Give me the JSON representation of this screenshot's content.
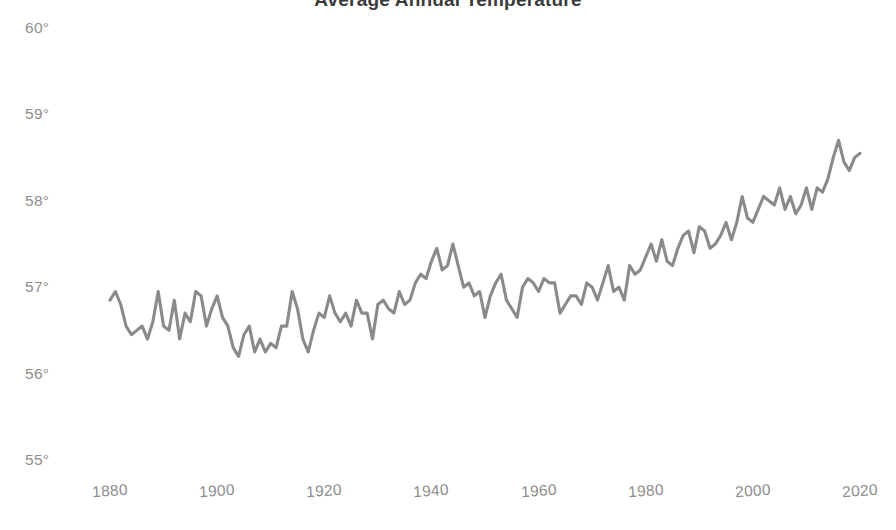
{
  "chart_data": {
    "type": "line",
    "title": "Average Annual Temperature",
    "xlabel": "",
    "ylabel": "",
    "grid": false,
    "legend": "none",
    "line_color": "#8a8a8a",
    "background_color": "#ffffff",
    "xlim": [
      1878,
      2021
    ],
    "ylim": [
      55,
      60
    ],
    "x_ticks": [
      "1880",
      "1900",
      "1920",
      "1940",
      "1960",
      "1980",
      "2000",
      "2020"
    ],
    "x_tick_values": [
      1880,
      1900,
      1920,
      1940,
      1960,
      1980,
      2000,
      2020
    ],
    "y_ticks": [
      "55°",
      "56°",
      "57°",
      "58°",
      "59°",
      "60°"
    ],
    "y_tick_values": [
      55,
      56,
      57,
      58,
      59,
      60
    ],
    "series": [
      {
        "name": "Average annual temperature",
        "x": [
          1880,
          1881,
          1882,
          1883,
          1884,
          1885,
          1886,
          1887,
          1888,
          1889,
          1890,
          1891,
          1892,
          1893,
          1894,
          1895,
          1896,
          1897,
          1898,
          1899,
          1900,
          1901,
          1902,
          1903,
          1904,
          1905,
          1906,
          1907,
          1908,
          1909,
          1910,
          1911,
          1912,
          1913,
          1914,
          1915,
          1916,
          1917,
          1918,
          1919,
          1920,
          1921,
          1922,
          1923,
          1924,
          1925,
          1926,
          1927,
          1928,
          1929,
          1930,
          1931,
          1932,
          1933,
          1934,
          1935,
          1936,
          1937,
          1938,
          1939,
          1940,
          1941,
          1942,
          1943,
          1944,
          1945,
          1946,
          1947,
          1948,
          1949,
          1950,
          1951,
          1952,
          1953,
          1954,
          1955,
          1956,
          1957,
          1958,
          1959,
          1960,
          1961,
          1962,
          1963,
          1964,
          1965,
          1966,
          1967,
          1968,
          1969,
          1970,
          1971,
          1972,
          1973,
          1974,
          1975,
          1976,
          1977,
          1978,
          1979,
          1980,
          1981,
          1982,
          1983,
          1984,
          1985,
          1986,
          1987,
          1988,
          1989,
          1990,
          1991,
          1992,
          1993,
          1994,
          1995,
          1996,
          1997,
          1998,
          1999,
          2000,
          2001,
          2002,
          2003,
          2004,
          2005,
          2006,
          2007,
          2008,
          2009,
          2010,
          2011,
          2012,
          2013,
          2014,
          2015,
          2016,
          2017,
          2018,
          2019,
          2020
        ],
        "values": [
          56.85,
          56.95,
          56.8,
          56.55,
          56.45,
          56.5,
          56.55,
          56.4,
          56.6,
          56.95,
          56.55,
          56.5,
          56.85,
          56.4,
          56.7,
          56.6,
          56.95,
          56.9,
          56.55,
          56.75,
          56.9,
          56.65,
          56.55,
          56.3,
          56.2,
          56.45,
          56.55,
          56.25,
          56.4,
          56.25,
          56.35,
          56.3,
          56.55,
          56.55,
          56.95,
          56.75,
          56.4,
          56.25,
          56.5,
          56.7,
          56.65,
          56.9,
          56.7,
          56.6,
          56.7,
          56.55,
          56.85,
          56.7,
          56.7,
          56.4,
          56.8,
          56.85,
          56.75,
          56.7,
          56.95,
          56.8,
          56.85,
          57.05,
          57.15,
          57.1,
          57.3,
          57.45,
          57.2,
          57.25,
          57.5,
          57.25,
          57.0,
          57.05,
          56.9,
          56.95,
          56.65,
          56.9,
          57.05,
          57.15,
          56.85,
          56.75,
          56.65,
          57.0,
          57.1,
          57.05,
          56.95,
          57.1,
          57.05,
          57.05,
          56.7,
          56.8,
          56.9,
          56.9,
          56.8,
          57.05,
          57.0,
          56.85,
          57.05,
          57.25,
          56.95,
          57.0,
          56.85,
          57.25,
          57.15,
          57.2,
          57.35,
          57.5,
          57.3,
          57.55,
          57.3,
          57.25,
          57.45,
          57.6,
          57.65,
          57.4,
          57.7,
          57.65,
          57.45,
          57.5,
          57.6,
          57.75,
          57.55,
          57.75,
          58.05,
          57.8,
          57.75,
          57.9,
          58.05,
          58.0,
          57.95,
          58.15,
          57.9,
          58.05,
          57.85,
          57.95,
          58.15,
          57.9,
          58.15,
          58.1,
          58.25,
          58.5,
          58.7,
          58.45,
          58.35,
          58.5,
          58.55
        ]
      }
    ]
  }
}
